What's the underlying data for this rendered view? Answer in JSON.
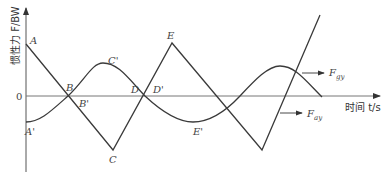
{
  "diagram": {
    "y_axis_label": "惯性力 F/BW",
    "x_axis_label": "时间 t/s",
    "zero_label": "0",
    "points": {
      "A": "A",
      "B": "B",
      "C": "C",
      "D": "D",
      "E": "E",
      "A_prime": "A'",
      "B_prime": "B'",
      "C_prime": "C'",
      "D_prime": "D'",
      "E_prime": "E'"
    },
    "curves": [
      {
        "name": "F",
        "subscript": "gy",
        "shape": "sinusoid"
      },
      {
        "name": "F",
        "subscript": "ay",
        "shape": "triangle wave"
      }
    ],
    "colors": {
      "line": "#3a3a3a",
      "axis": "#555555",
      "background": "#ffffff"
    }
  }
}
